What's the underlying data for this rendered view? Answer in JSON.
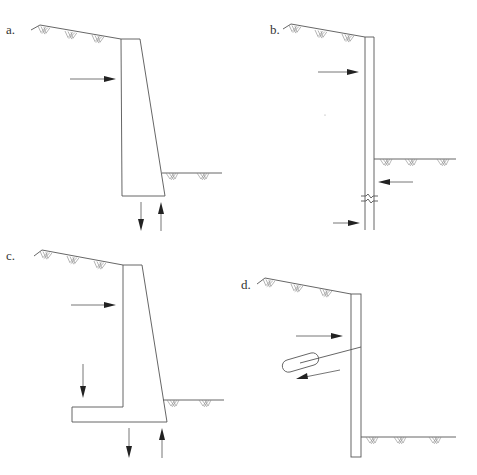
{
  "figure": {
    "panels": [
      {
        "id": "a",
        "label": "a.",
        "description": "gravity retaining wall with lateral earth pressure and base reactions"
      },
      {
        "id": "b",
        "label": "b.",
        "description": "cantilever sheet pile wall with active and passive pressures"
      },
      {
        "id": "c",
        "label": "c.",
        "description": "cantilever (L-shaped) retaining wall with footing"
      },
      {
        "id": "d",
        "label": "d.",
        "description": "anchored sheet pile wall with tieback grout anchor"
      }
    ],
    "colors": {
      "line": "#555555",
      "arrowhead": "#222222",
      "background": "#ffffff"
    }
  }
}
